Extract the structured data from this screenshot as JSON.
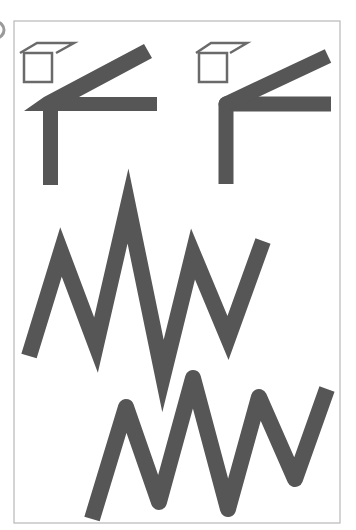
{
  "diagram": {
    "colors": {
      "stroke": "#565656",
      "frame": "#b8b8b8",
      "cube": "#6a6a6a",
      "background": "#ffffff"
    },
    "panels": [
      {
        "name": "miter-join-corner",
        "join": "miter",
        "has_cube_icon": true
      },
      {
        "name": "round-join-corner",
        "join": "round",
        "has_cube_icon": true
      },
      {
        "name": "miter-zigzag",
        "join": "miter"
      },
      {
        "name": "round-zigzag",
        "join": "round"
      }
    ]
  }
}
